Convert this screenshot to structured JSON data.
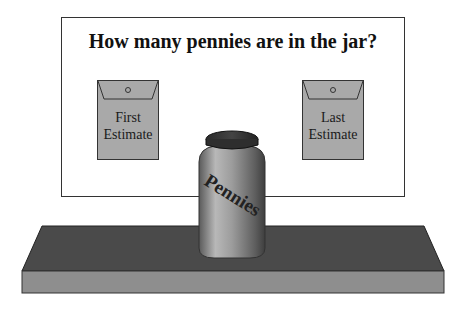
{
  "title": "How many pennies are in the jar?",
  "envelopes": [
    {
      "line1": "First",
      "line2": "Estimate"
    },
    {
      "line1": "Last",
      "line2": "Estimate"
    }
  ],
  "jar": {
    "label": "Pennies"
  },
  "colors": {
    "envelope": "#a9a9a9",
    "shelf_top": "#4a4a4a",
    "shelf_front": "#8e8e8e",
    "jar_lid": "#3a3a3a",
    "jar_body": "#9a9a9a"
  }
}
